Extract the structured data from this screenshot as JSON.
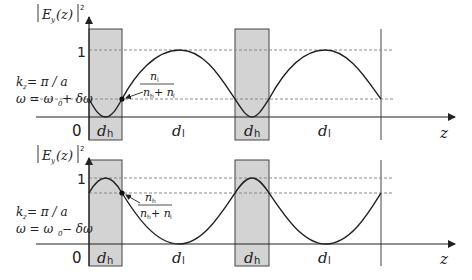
{
  "figure": {
    "colors": {
      "shading": "#d3d3d3",
      "curve": "#222222",
      "axis": "#222222",
      "dashed": "#808080"
    },
    "panels": [
      {
        "id": "upper",
        "y_axis_label": "|E_y(z)|²",
        "y_tick_one": "1",
        "origin_label": "0",
        "x_axis_label": "z",
        "condition_k": "k_z = π / a",
        "condition_omega": "ω = ω₀ + δω",
        "fraction_numerator": "n_l",
        "fraction_denominator": "n_h + n_l",
        "layer_labels": [
          "d_h",
          "d_l",
          "d_h",
          "d_l"
        ],
        "field_concentration": "low-index layers (d_l)"
      },
      {
        "id": "lower",
        "y_axis_label": "|E_y(z)|²",
        "y_tick_one": "1",
        "origin_label": "0",
        "x_axis_label": "z",
        "condition_k": "k_z = π / a",
        "condition_omega": "ω = ω₀ − δω",
        "fraction_numerator": "n_h",
        "fraction_denominator": "n_h + n_l",
        "layer_labels": [
          "d_h",
          "d_l",
          "d_h",
          "d_l"
        ],
        "field_concentration": "high-index layers (d_h)"
      }
    ]
  },
  "text": {
    "upper": {
      "ylabel_main": "E",
      "ylabel_sub": "y",
      "ylabel_arg": "(z)",
      "ylabel_sup": "2",
      "one": "1",
      "zero": "0",
      "z": "z",
      "k_main": "k",
      "k_sub": "z",
      "k_rhs": " = π / a",
      "w_lhs": "ω = ω",
      "w_sub": "0",
      "w_rhs": " + δω",
      "num_main": "n",
      "num_sub": "l",
      "den_main1": "n",
      "den_sub1": "h",
      "den_plus": " + n",
      "den_sub2": "l",
      "dh": "d",
      "dh_sub": "h",
      "dl": "d",
      "dl_sub": "l"
    },
    "lower": {
      "ylabel_main": "E",
      "ylabel_sub": "y",
      "ylabel_arg": "(z)",
      "ylabel_sup": "2",
      "one": "1",
      "zero": "0",
      "z": "z",
      "k_main": "k",
      "k_sub": "z",
      "k_rhs": " = π / a",
      "w_lhs": "ω = ω",
      "w_sub": "0",
      "w_rhs": " − δω",
      "num_main": "n",
      "num_sub": "h",
      "den_main1": "n",
      "den_sub1": "h",
      "den_plus": " + n",
      "den_sub2": "l",
      "dh": "d",
      "dh_sub": "h",
      "dl": "d",
      "dl_sub": "l"
    }
  }
}
